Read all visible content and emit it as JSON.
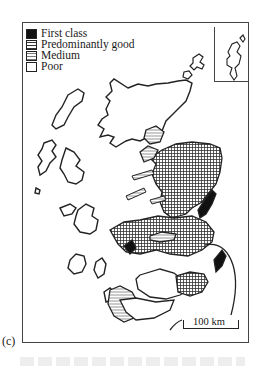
{
  "figure": {
    "caption_label": "(c)"
  },
  "legend": {
    "items": [
      {
        "label": "First class",
        "pattern": "solid-black",
        "color": "#111111"
      },
      {
        "label": "Predominantly good",
        "pattern": "cross-hatch",
        "color": "#555555"
      },
      {
        "label": "Medium",
        "pattern": "horizontal-lines",
        "color": "#888888"
      },
      {
        "label": "Poor",
        "pattern": "blank",
        "color": "#ffffff"
      }
    ]
  },
  "scale_bar": {
    "label": "100 km"
  },
  "inset": {
    "description": "Shetland Islands inset"
  },
  "colors": {
    "ink": "#1a1a1a",
    "background": "#ffffff",
    "first_class": "#111111"
  }
}
